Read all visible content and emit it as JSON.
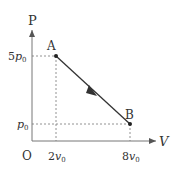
{
  "diagram": {
    "axes": {
      "y_label": "P",
      "x_label": "V",
      "origin_label": "O"
    },
    "points": [
      {
        "name": "A",
        "p": "5p0",
        "v": "2v0"
      },
      {
        "name": "B",
        "p": "p0",
        "v": "8v0"
      }
    ],
    "ticks": {
      "y": [
        {
          "coef": "5",
          "sym": "p",
          "sub": "0"
        },
        {
          "coef": "",
          "sym": "p",
          "sub": "0"
        }
      ],
      "x": [
        {
          "coef": "2",
          "sym": "v",
          "sub": "0"
        },
        {
          "coef": "8",
          "sym": "v",
          "sub": "0"
        }
      ]
    },
    "process": "straight line from A to B with arrow indicating direction A→B"
  }
}
